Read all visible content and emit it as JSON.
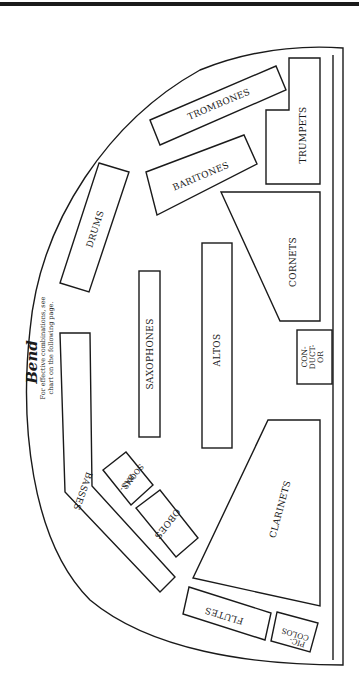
{
  "header": {
    "rule": true
  },
  "diagram": {
    "title": "Bend",
    "note_line1": "For effective combinations, see",
    "note_line2": "chart on the following page.",
    "colors": {
      "ink": "#1a1a1a",
      "paper": "#ffffff"
    },
    "sections": {
      "trombones": "TROMBONES",
      "trumpets": "TRUMPETS",
      "baritones": "BARITONES",
      "drums": "DRUMS",
      "cornets": "CORNETS",
      "saxophones": "SAXOPHONES",
      "altos": "ALTOS",
      "conductor_1": "CON-",
      "conductor_2": "DUCT-",
      "conductor_3": "OR",
      "basses": "BASSES",
      "bassoons_1": "BAS-",
      "bassoons_2": "SOONS",
      "oboes": "OBOES",
      "clarinets": "CLARINETS",
      "flutes": "FLUTES",
      "piccolos_1": "PIC-",
      "piccolos_2": "COLOS"
    }
  }
}
